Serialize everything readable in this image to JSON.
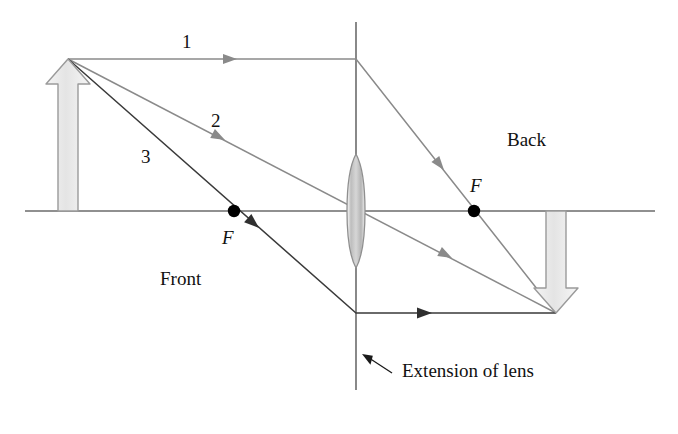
{
  "figure": {
    "type": "ray-diagram",
    "background_color": "#ffffff",
    "width": 678,
    "height": 434
  },
  "colors": {
    "axis": "#6b6b6b",
    "ray_gray": "#8a8a8a",
    "ray_dark": "#3a3a3a",
    "lens_fill": "#c9c9c9",
    "lens_stroke": "#8f8f8f",
    "arrow_fill": "#e8e8e8",
    "arrow_stroke": "#9a9a9a",
    "focal_dot": "#000000",
    "text": "#111111",
    "extension_line": "#6b6b6b"
  },
  "labels": {
    "ray1": "1",
    "ray2": "2",
    "ray3": "3",
    "focal_front": "F",
    "focal_back": "F",
    "side_front": "Front",
    "side_back": "Back",
    "extension_of_lens": "Extension of lens"
  },
  "geometry": {
    "axis": {
      "x1": 25,
      "y1": 211,
      "x2": 655,
      "y2": 211
    },
    "lens_plane": {
      "x": 356,
      "y_top": 22,
      "y_bottom": 390
    },
    "lens": {
      "cx": 356,
      "cy": 211,
      "rx": 11,
      "ry": 57
    },
    "object_arrow": {
      "x": 68,
      "y_base": 211,
      "y_tip": 59
    },
    "image_arrow": {
      "x": 556,
      "y_base": 211,
      "y_tip": 313
    },
    "object_tip": {
      "x": 68,
      "y": 59
    },
    "image_tip": {
      "x": 556,
      "y": 313
    },
    "focal_front_point": {
      "x": 234,
      "y": 211
    },
    "focal_back_point": {
      "x": 474,
      "y": 211
    },
    "pointer_arrow": {
      "x_tail": 392,
      "y_tail": 373,
      "x_head": 362,
      "y_head": 354
    }
  },
  "label_positions": {
    "ray1": {
      "x": 182,
      "y": 32
    },
    "ray2": {
      "x": 211,
      "y": 111
    },
    "ray3": {
      "x": 141,
      "y": 147
    },
    "focal_front": {
      "x": 222,
      "y": 228
    },
    "focal_back": {
      "x": 470,
      "y": 176
    },
    "side_front": {
      "x": 160,
      "y": 269
    },
    "side_back": {
      "x": 507,
      "y": 130
    },
    "extension_of_lens": {
      "x": 402,
      "y": 361
    }
  },
  "rays": [
    {
      "id": "ray1",
      "name": "parallel-ray-through-back-focus",
      "description": "Travels parallel to the axis from the object tip, refracts at the lens plane, then passes through the back focal point F and on to the image tip.",
      "color": "#8a8a8a",
      "points": [
        [
          68,
          59
        ],
        [
          356,
          59
        ],
        [
          556,
          313
        ]
      ],
      "arrowheads": [
        {
          "x": 237,
          "y": 59,
          "angle": 0
        },
        {
          "x": 444,
          "y": 170,
          "angle": 51.8
        }
      ]
    },
    {
      "id": "ray2",
      "name": "central-ray-through-lens-center",
      "description": "Passes undeviated straight through the center of the lens from the object tip to the image tip.",
      "color": "#8a8a8a",
      "points": [
        [
          68,
          59
        ],
        [
          556,
          313
        ]
      ],
      "arrowheads": [
        {
          "x": 225,
          "y": 140,
          "angle": 27.5
        },
        {
          "x": 452,
          "y": 258,
          "angle": 27.5
        }
      ]
    },
    {
      "id": "ray3",
      "name": "front-focus-ray-emerging-parallel",
      "description": "Leaves the object tip through the front focal point F, strikes the lens plane and emerges parallel to the axis toward the image tip.",
      "color": "#3a3a3a",
      "points": [
        [
          68,
          59
        ],
        [
          356,
          313
        ],
        [
          556,
          313
        ]
      ],
      "arrowheads": [
        {
          "x": 259,
          "y": 228,
          "angle": 41.4
        },
        {
          "x": 432,
          "y": 313,
          "angle": 0
        }
      ]
    }
  ]
}
